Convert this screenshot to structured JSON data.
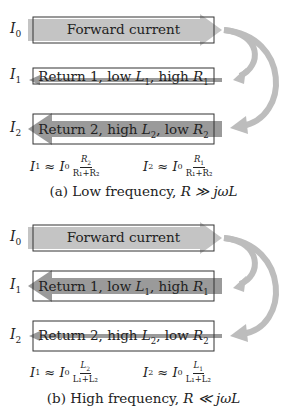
{
  "colors": {
    "arrow_light": "#c4c4c4",
    "arrow_dark": "#9a9a9a",
    "curve": "#bdbdbd",
    "box_border": "#333333"
  },
  "panel_a": {
    "current_labels": [
      {
        "base": "I",
        "sub": "0"
      },
      {
        "base": "I",
        "sub": "1"
      },
      {
        "base": "I",
        "sub": "2"
      }
    ],
    "forward": {
      "text": "Forward current"
    },
    "return1": {
      "prefix": "Return 1, low ",
      "L": "L",
      "Lsub": "1",
      "mid": ", high ",
      "R": "R",
      "Rsub": "1",
      "arrow": "thin"
    },
    "return2": {
      "prefix": "Return 2, high ",
      "L": "L",
      "Lsub": "2",
      "mid": ", low ",
      "R": "R",
      "Rsub": "2",
      "arrow": "thick"
    },
    "formula1": {
      "lhs": "I",
      "lhs_sub": "1",
      "approx": " ≈ ",
      "I0": "I",
      "I0_sub": "0",
      "num": "R",
      "num_sub": "2",
      "den": "R₁+R₂"
    },
    "formula2": {
      "lhs": "I",
      "lhs_sub": "2",
      "approx": " ≈ ",
      "I0": "I",
      "I0_sub": "0",
      "num": "R",
      "num_sub": "1",
      "den": "R₁+R₂"
    },
    "caption_prefix": "(a) Low frequency, ",
    "caption_math": "R ≫ jωL"
  },
  "panel_b": {
    "current_labels": [
      {
        "base": "I",
        "sub": "0"
      },
      {
        "base": "I",
        "sub": "1"
      },
      {
        "base": "I",
        "sub": "2"
      }
    ],
    "forward": {
      "text": "Forward current"
    },
    "return1": {
      "prefix": "Return 1, low ",
      "L": "L",
      "Lsub": "1",
      "mid": ", high ",
      "R": "R",
      "Rsub": "1",
      "arrow": "thick"
    },
    "return2": {
      "prefix": "Return 2, high ",
      "L": "L",
      "Lsub": "2",
      "mid": ", low ",
      "R": "R",
      "Rsub": "2",
      "arrow": "thin"
    },
    "formula1": {
      "lhs": "I",
      "lhs_sub": "1",
      "approx": " ≈ ",
      "I0": "I",
      "I0_sub": "0",
      "num": "L",
      "num_sub": "2",
      "den": "L₁+L₂"
    },
    "formula2": {
      "lhs": "I",
      "lhs_sub": "2",
      "approx": " ≈ ",
      "I0": "I",
      "I0_sub": "0",
      "num": "L",
      "num_sub": "1",
      "den": "L₁+L₂"
    },
    "caption_prefix": "(b) High frequency, ",
    "caption_math": "R ≪ jωL"
  }
}
